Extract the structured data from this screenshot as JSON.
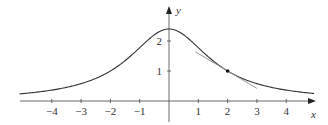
{
  "chart_data": {
    "type": "line",
    "title": "",
    "xlabel": "x",
    "ylabel": "y",
    "xlim": [
      -5.1,
      5.0
    ],
    "ylim": [
      0,
      2.9
    ],
    "grid": false,
    "legend": null,
    "x_ticks": [
      -4,
      -3,
      -2,
      -1,
      1,
      2,
      3,
      4
    ],
    "x_tick_labels": [
      "−4",
      "−3",
      "−2",
      "−1",
      "1",
      "2",
      "3",
      "4"
    ],
    "y_ticks": [
      1,
      2
    ],
    "y_tick_labels": [
      "1",
      "2"
    ],
    "series": [
      {
        "name": "curve",
        "description": "bell-shaped curve, approx y = 6.86/(x^2 + 2.86)",
        "color": "#333333",
        "x": [
          -5,
          -4,
          -3,
          -2,
          -1,
          0,
          1,
          2,
          3,
          4,
          5
        ],
        "y": [
          0.25,
          0.36,
          0.58,
          1.0,
          1.78,
          2.4,
          1.78,
          1.0,
          0.58,
          0.36,
          0.25
        ]
      },
      {
        "name": "tangent line at (2, 1)",
        "color": "#888888",
        "x": [
          0.9,
          3.0
        ],
        "y": [
          1.64,
          0.42
        ]
      }
    ],
    "annotations": [
      {
        "type": "point",
        "x": 2,
        "y": 1,
        "label": ""
      }
    ]
  },
  "axes": {
    "x_label": "x",
    "y_label": "y"
  }
}
